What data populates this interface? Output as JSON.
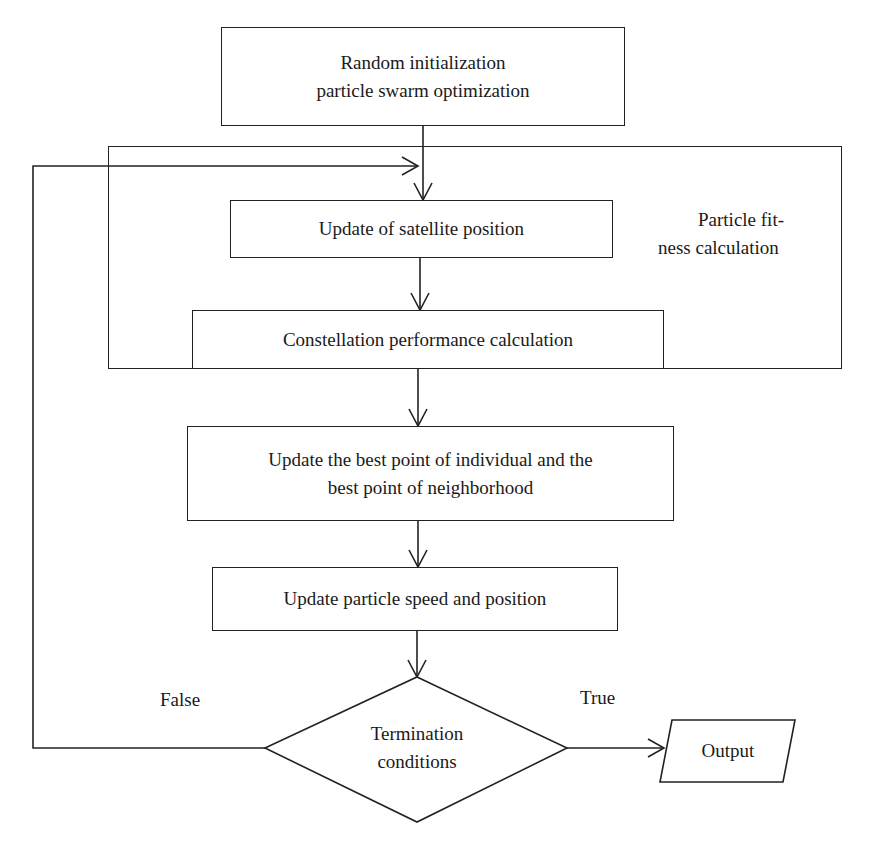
{
  "diagram": {
    "type": "flowchart",
    "nodes": {
      "init": {
        "line1": "Random initialization",
        "line2": "particle swarm optimization"
      },
      "satellite": {
        "label": "Update of satellite position"
      },
      "constellation": {
        "label": "Constellation performance calculation"
      },
      "best_point": {
        "line1": "Update the best point of individual and the",
        "line2": "best point of neighborhood"
      },
      "speed": {
        "label": "Update particle speed and position"
      },
      "decision": {
        "line1": "Termination",
        "line2": "conditions"
      },
      "output": {
        "label": "Output"
      }
    },
    "group": {
      "line1": "Particle fit-",
      "line2": "ness calculation"
    },
    "edge_labels": {
      "false": "False",
      "true": "True"
    },
    "edges": [
      {
        "from": "init",
        "to": "satellite"
      },
      {
        "from": "satellite",
        "to": "constellation"
      },
      {
        "from": "constellation",
        "to": "best_point"
      },
      {
        "from": "best_point",
        "to": "speed"
      },
      {
        "from": "speed",
        "to": "decision"
      },
      {
        "from": "decision",
        "to": "output",
        "label": "True"
      },
      {
        "from": "decision",
        "to": "satellite",
        "label": "False"
      }
    ]
  }
}
